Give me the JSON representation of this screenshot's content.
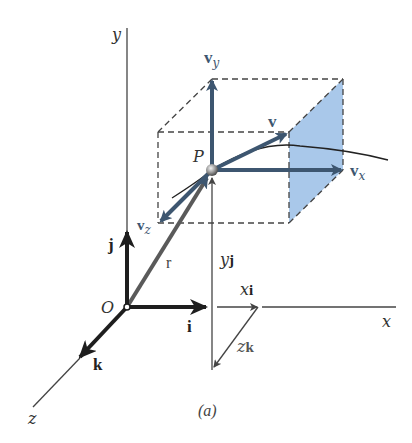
{
  "figure": {
    "caption": "(a)",
    "axes": {
      "x_label": "x",
      "y_label": "y",
      "z_label": "z",
      "origin_label": "O"
    },
    "unit_vectors": {
      "i": "i",
      "j": "j",
      "k": "k"
    },
    "position": {
      "r_label": "r",
      "point_label": "P",
      "xi_label_var": "x",
      "xi_label_vec": "i",
      "yj_label_var": "y",
      "yj_label_vec": "j",
      "zk_label_var": "z",
      "zk_label_vec": "k"
    },
    "velocity": {
      "v_label": "v",
      "vx_base": "v",
      "vx_sub": "x",
      "vy_base": "v",
      "vy_sub": "y",
      "vz_base": "v",
      "vz_sub": "z"
    },
    "colors": {
      "velocity_arrow": "#3d5670",
      "face_fill": "#a9c8ea",
      "axis_line": "#444444",
      "unit_vector": "#1e1e1e",
      "position_vector": "#555555"
    }
  }
}
